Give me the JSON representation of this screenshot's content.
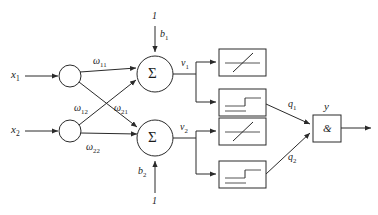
{
  "diagram": {
    "stroke_color": "#2a2a2a",
    "text_color": "#1b1b1b",
    "background_color": "#ffffff"
  },
  "inputs": [
    {
      "label": "x",
      "sub": "1",
      "name": "input-x1"
    },
    {
      "label": "x",
      "sub": "2",
      "name": "input-x2"
    }
  ],
  "weights": [
    {
      "label": "ω",
      "sub": "11",
      "name": "weight-w11"
    },
    {
      "label": "ω",
      "sub": "12",
      "name": "weight-w12"
    },
    {
      "label": "ω",
      "sub": "21",
      "name": "weight-w21"
    },
    {
      "label": "ω",
      "sub": "22",
      "name": "weight-w22"
    }
  ],
  "biases": [
    {
      "label": "b",
      "sub": "1",
      "source_value": "1",
      "name": "bias-b1"
    },
    {
      "label": "b",
      "sub": "2",
      "source_value": "1",
      "name": "bias-b2"
    }
  ],
  "summations": [
    {
      "glyph": "Σ",
      "name": "summation-node-1"
    },
    {
      "glyph": "Σ",
      "name": "summation-node-2"
    }
  ],
  "nets": [
    {
      "label": "v",
      "sub": "1",
      "name": "net-input-v1"
    },
    {
      "label": "v",
      "sub": "2",
      "name": "net-input-v2"
    }
  ],
  "activation_boxes": [
    {
      "kind": "ramp",
      "icon": "ramp-function-icon",
      "name": "activation-ramp-1"
    },
    {
      "kind": "step",
      "icon": "step-function-icon",
      "name": "activation-step-1"
    },
    {
      "kind": "ramp",
      "icon": "ramp-function-icon",
      "name": "activation-ramp-2"
    },
    {
      "kind": "step",
      "icon": "step-function-icon",
      "name": "activation-step-2"
    }
  ],
  "intermediates": [
    {
      "label": "q",
      "sub": "1",
      "name": "signal-q1"
    },
    {
      "label": "q",
      "sub": "2",
      "name": "signal-q2"
    }
  ],
  "combiner": {
    "glyph": "&",
    "name": "and-gate",
    "output": {
      "label": "y",
      "name": "output-y"
    }
  }
}
